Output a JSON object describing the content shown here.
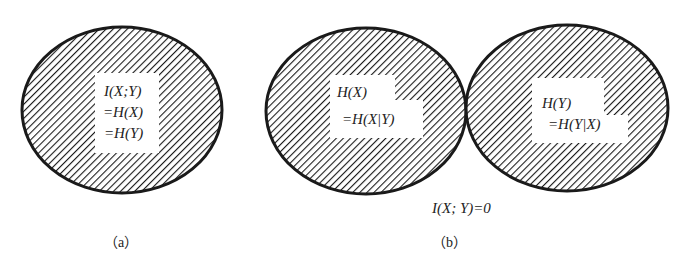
{
  "diagram": {
    "panel_a": {
      "caption": "（a）",
      "circle_label_lines": [
        "I(X;Y)",
        "=H(X)",
        "=H(Y)"
      ]
    },
    "panel_b": {
      "caption": "（b）",
      "left_circle_label_lines": [
        "H(X)",
        "=H(X|Y)"
      ],
      "right_circle_label_lines": [
        "H(Y)",
        "=H(Y|X)"
      ],
      "bottom_label": "I(X; Y)=0"
    },
    "colors": {
      "stroke": "#1a1a1a",
      "hatch": "#1a1a1a",
      "background": "#ffffff"
    }
  }
}
